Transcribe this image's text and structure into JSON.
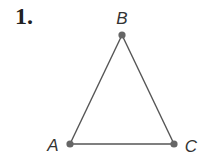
{
  "problem": {
    "number": "1."
  },
  "figure": {
    "shape": "triangle",
    "colors": {
      "line": "#555555",
      "vertex": "#666666",
      "label": "#333333"
    },
    "vertices": [
      {
        "name": "B",
        "x": 122,
        "y": 35,
        "label_x": 122,
        "label_y": 24
      },
      {
        "name": "A",
        "x": 70,
        "y": 144,
        "label_x": 53,
        "label_y": 151
      },
      {
        "name": "C",
        "x": 174,
        "y": 144,
        "label_x": 191,
        "label_y": 152
      }
    ]
  }
}
